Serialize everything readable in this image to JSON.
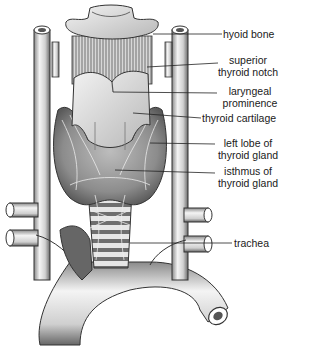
{
  "figure": {
    "labels": [
      {
        "id": "hyoid-bone",
        "lines": [
          "hyoid bone"
        ]
      },
      {
        "id": "superior-thyroid-notch",
        "lines": [
          "superior",
          "thyroid notch"
        ]
      },
      {
        "id": "laryngeal-prominence",
        "lines": [
          "laryngeal",
          "prominence"
        ]
      },
      {
        "id": "thyroid-cartilage",
        "lines": [
          "thyroid cartilage"
        ]
      },
      {
        "id": "left-lobe",
        "lines": [
          "left lobe of",
          "thyroid gland"
        ]
      },
      {
        "id": "isthmus",
        "lines": [
          "isthmus of",
          "thyroid gland"
        ]
      },
      {
        "id": "trachea",
        "lines": [
          "trachea"
        ]
      }
    ]
  },
  "colors": {
    "background": "#ffffff",
    "ink": "#1a1a1a",
    "shade_dark": "#555555",
    "shade_mid": "#9a9a9a",
    "shade_light": "#dcdcdc"
  }
}
